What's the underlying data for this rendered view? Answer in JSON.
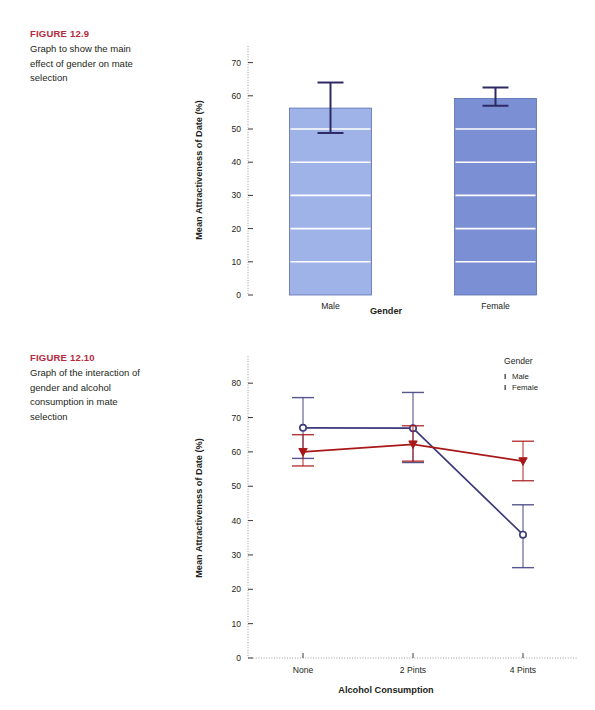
{
  "figures": [
    {
      "label": "FIGURE 12.9",
      "caption": "Graph to show the main effect of gender on mate selection",
      "label_color": "#b5293d"
    },
    {
      "label": "FIGURE 12.10",
      "caption": "Graph of the interaction of gender and alcohol consumption in mate selection",
      "label_color": "#b5293d"
    }
  ],
  "chart_data": [
    {
      "type": "bar",
      "title": "",
      "categories": [
        "Male",
        "Female"
      ],
      "values": [
        56.3,
        59.2
      ],
      "error_upper": [
        64.0,
        62.5
      ],
      "error_lower": [
        48.8,
        57.0
      ],
      "xlabel": "Gender",
      "ylabel": "Mean Attractiveness of Date (%)",
      "ylim": [
        0,
        75
      ],
      "yticks": [
        0,
        10,
        20,
        30,
        40,
        50,
        60,
        70
      ],
      "ytick_labels": [
        "0",
        "10",
        "20",
        "30",
        "40",
        "50",
        "60",
        "70"
      ],
      "bar_colors": [
        "#9fb3e8",
        "#7b8fd4"
      ],
      "bar_edge_color": "#5a6fae",
      "error_color": "#2e2a66",
      "gridlines": true,
      "gridline_color": "#ffffff",
      "legend": "none"
    },
    {
      "type": "line",
      "title": "",
      "x": [
        "None",
        "2 Pints",
        "4 Pints"
      ],
      "series": [
        {
          "name": "Male",
          "color": "#3b3a7a",
          "marker": "open-circle",
          "values": [
            67.0,
            66.9,
            35.9
          ],
          "error_upper": [
            75.8,
            77.3,
            44.6
          ],
          "error_lower": [
            58.1,
            56.9,
            26.3
          ]
        },
        {
          "name": "Female",
          "color": "#a81818",
          "marker": "filled-triangle-down",
          "values": [
            60.0,
            62.2,
            57.3
          ],
          "error_upper": [
            65.0,
            67.6,
            63.1
          ],
          "error_lower": [
            55.9,
            57.3,
            51.6
          ]
        }
      ],
      "xlabel": "Alcohol Consumption",
      "ylabel": "Mean Attractiveness of Date (%)",
      "ylim": [
        0,
        85
      ],
      "yticks": [
        0,
        10,
        20,
        30,
        40,
        50,
        60,
        70,
        80
      ],
      "ytick_labels": [
        "0",
        "10",
        "20",
        "30",
        "40",
        "50",
        "60",
        "70",
        "80"
      ],
      "legend_title": "Gender",
      "legend_position": "right",
      "legend_entries": [
        "Male",
        "Female"
      ],
      "legend_marker": "I",
      "gridlines": false
    }
  ]
}
